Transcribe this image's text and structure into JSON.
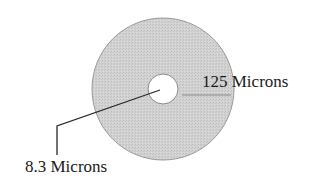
{
  "diagram": {
    "colors": {
      "cladding_fill": "#cfcfcf",
      "cladding_stroke": "#9a9a9a",
      "core_fill": "#ffffff",
      "core_stroke": "#8a8a8a",
      "leader_line": "#2a2a2a",
      "dimension_line": "#8a8a8a",
      "text": "#1a1a1a"
    },
    "outer_circle": {
      "name": "cladding",
      "cx": 163,
      "cy": 89,
      "r": 71
    },
    "inner_circle": {
      "name": "core",
      "cx": 163,
      "cy": 89,
      "r": 15
    },
    "labels": {
      "cladding": "125 Microns",
      "core": "8.3 Microns"
    }
  }
}
